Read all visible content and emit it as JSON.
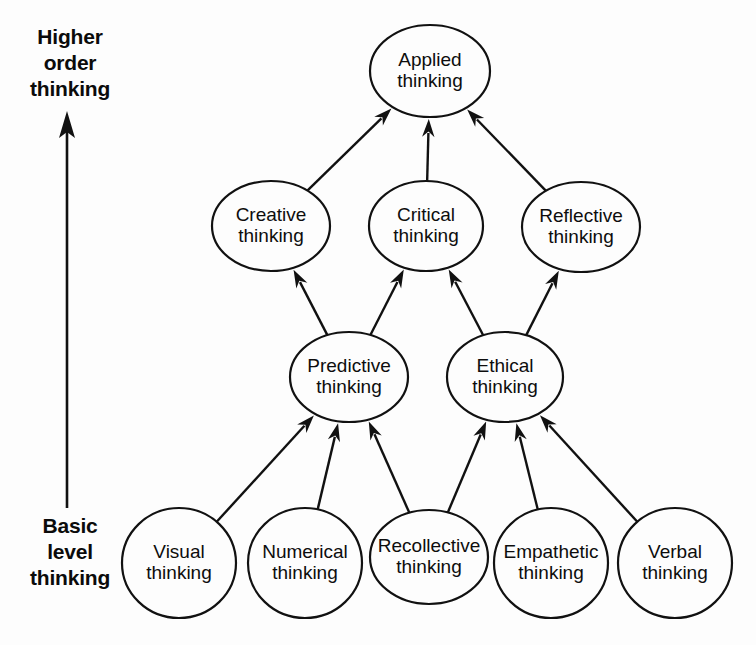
{
  "diagram": {
    "background_color": "#fdfdfd",
    "stroke_color": "#111111",
    "text_color": "#0d0d0d",
    "axis": {
      "top_label_lines": [
        "Higher",
        "order",
        "thinking"
      ],
      "top_label_text": "Higher order thinking",
      "bottom_label_lines": [
        "Basic",
        "level",
        "thinking"
      ],
      "bottom_label_text": "Basic level thinking",
      "direction": "upward",
      "arrow_name": "upward-progression-arrow"
    },
    "levels": [
      {
        "level": 4,
        "name": "applied",
        "nodes": [
          "Applied thinking"
        ]
      },
      {
        "level": 3,
        "name": "higher-order",
        "nodes": [
          "Creative thinking",
          "Critical thinking",
          "Reflective thinking"
        ]
      },
      {
        "level": 2,
        "name": "intermediate",
        "nodes": [
          "Predictive thinking",
          "Ethical thinking"
        ]
      },
      {
        "level": 1,
        "name": "basic",
        "nodes": [
          "Visual thinking",
          "Numerical thinking",
          "Recollective thinking",
          "Empathetic thinking",
          "Verbal thinking"
        ]
      }
    ],
    "nodes": [
      {
        "id": "applied",
        "line1": "Applied",
        "line2": "thinking",
        "cx": 430,
        "cy": 71,
        "rx": 60,
        "ry": 46,
        "level": 4
      },
      {
        "id": "creative",
        "line1": "Creative",
        "line2": "thinking",
        "cx": 271,
        "cy": 226,
        "rx": 59,
        "ry": 45,
        "level": 3
      },
      {
        "id": "critical",
        "line1": "Critical",
        "line2": "thinking",
        "cx": 426,
        "cy": 226,
        "rx": 57,
        "ry": 45,
        "level": 3
      },
      {
        "id": "reflective",
        "line1": "Reflective",
        "line2": "thinking",
        "cx": 581,
        "cy": 227,
        "rx": 59,
        "ry": 45,
        "level": 3
      },
      {
        "id": "predictive",
        "line1": "Predictive",
        "line2": "thinking",
        "cx": 349,
        "cy": 377,
        "rx": 59,
        "ry": 45,
        "level": 2
      },
      {
        "id": "ethical",
        "line1": "Ethical",
        "line2": "thinking",
        "cx": 505,
        "cy": 377,
        "rx": 58,
        "ry": 45,
        "level": 2
      },
      {
        "id": "visual",
        "line1": "Visual",
        "line2": "thinking",
        "cx": 179,
        "cy": 563,
        "rx": 57,
        "ry": 55,
        "level": 1
      },
      {
        "id": "numerical",
        "line1": "Numerical",
        "line2": "thinking",
        "cx": 305,
        "cy": 563,
        "rx": 57,
        "ry": 55,
        "level": 1
      },
      {
        "id": "recollective",
        "line1": "Recollective",
        "line2": "thinking",
        "cx": 429,
        "cy": 557,
        "rx": 59,
        "ry": 47,
        "level": 1
      },
      {
        "id": "empathetic",
        "line1": "Empathetic",
        "line2": "thinking",
        "cx": 551,
        "cy": 563,
        "rx": 57,
        "ry": 55,
        "level": 1
      },
      {
        "id": "verbal",
        "line1": "Verbal",
        "line2": "thinking",
        "cx": 675,
        "cy": 563,
        "rx": 57,
        "ry": 55,
        "level": 1
      }
    ],
    "edges": [
      {
        "from": "creative",
        "to": "applied"
      },
      {
        "from": "critical",
        "to": "applied"
      },
      {
        "from": "reflective",
        "to": "applied"
      },
      {
        "from": "predictive",
        "to": "creative"
      },
      {
        "from": "predictive",
        "to": "critical"
      },
      {
        "from": "ethical",
        "to": "critical"
      },
      {
        "from": "ethical",
        "to": "reflective"
      },
      {
        "from": "visual",
        "to": "predictive"
      },
      {
        "from": "numerical",
        "to": "predictive"
      },
      {
        "from": "recollective",
        "to": "predictive"
      },
      {
        "from": "recollective",
        "to": "ethical"
      },
      {
        "from": "empathetic",
        "to": "ethical"
      },
      {
        "from": "verbal",
        "to": "ethical"
      }
    ]
  }
}
